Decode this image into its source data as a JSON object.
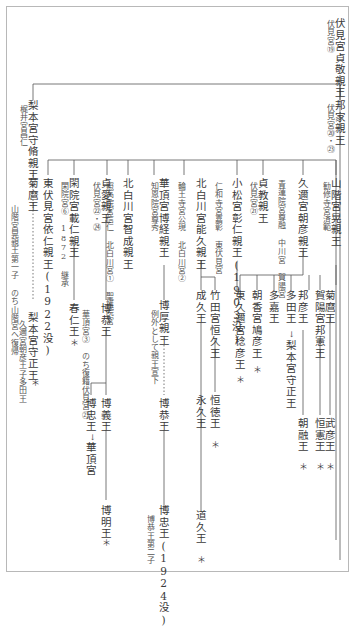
{
  "nodes": [
    {
      "id": "sadayoshi",
      "name": "伏見宮貞敬親王",
      "sub": "伏見宮⑲"
    },
    {
      "id": "kuniie",
      "name": "邦家親王",
      "sub": "伏見宮⑳・㉓"
    },
    {
      "id": "morimasa",
      "name": "梨本宮守脩親王",
      "sub": "梶井宮昌仁"
    },
    {
      "id": "kikumaro",
      "name": "菊麿王",
      "sub": "山階宮晃親王第一子 のち山階宮へ復帰"
    },
    {
      "id": "yamashina",
      "name": "山階宮晃親王",
      "sub": "勧修寺宮済範"
    },
    {
      "id": "kuninomiya",
      "name": "久邇宮朝彦親王",
      "sub": "青蓮院宮尊融 中川宮 賀陽宮"
    },
    {
      "id": "sadanaru",
      "name": "貞教親王",
      "sub": "伏見宮㉑"
    },
    {
      "id": "komatsu",
      "name": "小松宮彰仁親王(1903没)",
      "sub": "仁和寺宮嘉彰 東伏見宮"
    },
    {
      "id": "yoshihisa",
      "name": "北白川宮能久親王",
      "sub": "輪王寺宮公現 北白川宮②"
    },
    {
      "id": "hiroatsu_k",
      "name": "華頂宮博経親王",
      "sub": "知恩院宮尊秀"
    },
    {
      "id": "satonari",
      "name": "北白川宮智成親王",
      "sub": "照高院宮信仁 北白川宮① 聖護院宮"
    },
    {
      "id": "sadanaru2",
      "name": "貞愛親王",
      "sub": "伏見宮㉒・㉔"
    },
    {
      "id": "kanin",
      "name": "閑院宮載仁親王",
      "sub": "閑院宮⑥ 1872 継承"
    },
    {
      "id": "higashifushimi",
      "name": "東伏見宮依仁親王(1922没)",
      "sub": ""
    },
    {
      "id": "kikumaro2",
      "name": "菊麿王",
      "sub": ""
    },
    {
      "id": "takehiko",
      "name": "武彦王",
      "star": "＊"
    },
    {
      "id": "kaya",
      "name": "賀陽宮邦憲王",
      "sub": ""
    },
    {
      "id": "tsunenori",
      "name": "恒憲王",
      "star": "＊"
    },
    {
      "id": "kunihiko",
      "name": "邦彦王",
      "sub": ""
    },
    {
      "id": "asaakira",
      "name": "朝融王",
      "star": "＊"
    },
    {
      "id": "tada",
      "name": "多田王",
      "arrow": "梨本宮守正王"
    },
    {
      "id": "takaoo",
      "name": "多嘉王",
      "sub": ""
    },
    {
      "id": "asaka",
      "name": "朝香宮鳩彦王",
      "star": "＊"
    },
    {
      "id": "higashikuni",
      "name": "東久邇宮稔彦王",
      "star": "＊"
    },
    {
      "id": "takeda",
      "name": "竹田宮恒久王",
      "sub": ""
    },
    {
      "id": "tsunetoshi",
      "name": "恒徳王",
      "star": "＊"
    },
    {
      "id": "naruhisa",
      "name": "成久王",
      "sub": ""
    },
    {
      "id": "nagahisa",
      "name": "永久王",
      "sub": ""
    },
    {
      "id": "michihisa",
      "name": "道久王",
      "star": "＊"
    },
    {
      "id": "hiroatsu",
      "name": "博厚親王",
      "sub": "例外として親王宣下"
    },
    {
      "id": "hiroyasu2",
      "name": "博恭王",
      "sub": ""
    },
    {
      "id": "hirotada",
      "name": "博忠王(1924没)",
      "sub": "博恭王第二子"
    },
    {
      "id": "hiroyasu",
      "name": "博恭王",
      "sub": "華頂宮③ のち復籍伏見宮㉓"
    },
    {
      "id": "hiroyoshi",
      "name": "博義王",
      "sub": ""
    },
    {
      "id": "hirotada2",
      "name": "博忠王",
      "arrow": "華頂宮"
    },
    {
      "id": "hiroaki",
      "name": "博明王",
      "star": "＊"
    },
    {
      "id": "haruhito",
      "name": "春仁王",
      "star": "＊"
    },
    {
      "id": "morimasa2",
      "name": "梨本宮守正王",
      "sub": "久邇宮朝彦王子多田王",
      "star": "＊"
    }
  ]
}
